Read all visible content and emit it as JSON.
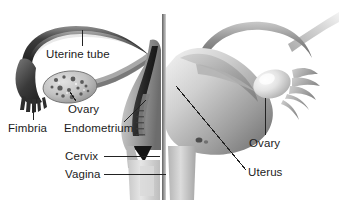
{
  "figure": {
    "background_color": "#ffffff",
    "text_color": "#1c1c1c",
    "leader_line_color": "#2b2b2b",
    "width": 339,
    "height": 212
  },
  "labels": {
    "uterine_tube": "Uterine tube",
    "ovary_left": "Ovary",
    "fimbria": "Fimbria",
    "endometrium": "Endometrium",
    "cervix": "Cervix",
    "vagina": "Vagina",
    "ovary_right": "Ovary",
    "uterus": "Uterus"
  }
}
